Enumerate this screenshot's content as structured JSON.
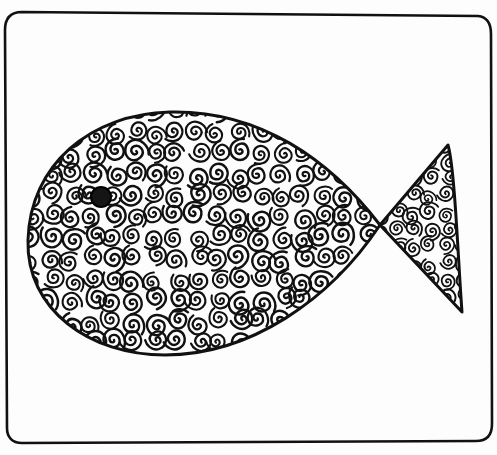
{
  "illustration": {
    "subject": "Hand-drawn fish filled with swirl doodles inside a rounded rectangle frame",
    "style": "black ink line drawing on white paper",
    "colors": {
      "ink": "#111111",
      "paper": "#fdfdfd"
    },
    "frame": {
      "shape": "rounded-rectangle"
    },
    "fish": {
      "body": "teardrop/oval body facing left",
      "eye": "solid dark filled circle near the front",
      "tail": "triangular forked tail on right",
      "pattern": "dense swirl/curl doodles"
    }
  }
}
